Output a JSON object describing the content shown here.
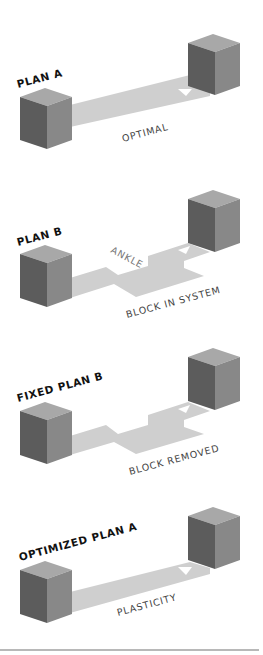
{
  "colors": {
    "cube_front": "#888888",
    "cube_side": "#5c5c5c",
    "cube_top": "#a8a8a8",
    "path": "#cfcfcf",
    "arrow": "#ffffff",
    "plan_label": "#111111",
    "path_label": "#444444",
    "rule": "#b8b8b8"
  },
  "panels": [
    {
      "id": "plan-a",
      "title": "PLAN A",
      "path_type": "straight",
      "caption": "OPTIMAL"
    },
    {
      "id": "plan-b",
      "title": "PLAN B",
      "path_type": "stepped",
      "obstacle_label": "ANKLE",
      "caption": "BLOCK IN SYSTEM"
    },
    {
      "id": "fixed-plan-b",
      "title": "FIXED PLAN B",
      "path_type": "stepped",
      "caption": "BLOCK REMOVED"
    },
    {
      "id": "optimized-plan-a",
      "title": "OPTIMIZED PLAN A",
      "path_type": "straight",
      "caption": "PLASTICITY"
    }
  ]
}
